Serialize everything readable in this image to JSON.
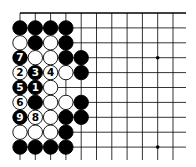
{
  "board": {
    "origin_x": 20,
    "origin_y": 13,
    "spacing_x": 15.3,
    "spacing_y": 14.9,
    "cols": 11,
    "rows": 10,
    "line_end_x": 186,
    "line_end_y": 160,
    "top_edge": true,
    "line_color": "#000000",
    "hoshi": [
      [
        9,
        3
      ],
      [
        9,
        9
      ]
    ]
  },
  "stones": [
    {
      "c": 0,
      "r": 1,
      "color": "black"
    },
    {
      "c": 1,
      "r": 1,
      "color": "black"
    },
    {
      "c": 2,
      "r": 1,
      "color": "black"
    },
    {
      "c": 3,
      "r": 1,
      "color": "black"
    },
    {
      "c": 0,
      "r": 2,
      "color": "white"
    },
    {
      "c": 1,
      "r": 2,
      "color": "black"
    },
    {
      "c": 2,
      "r": 2,
      "color": "white"
    },
    {
      "c": 3,
      "r": 2,
      "color": "black"
    },
    {
      "c": 0,
      "r": 3,
      "color": "black",
      "label": "7"
    },
    {
      "c": 1,
      "r": 3,
      "color": "white"
    },
    {
      "c": 2,
      "r": 3,
      "color": "white"
    },
    {
      "c": 3,
      "r": 3,
      "color": "black"
    },
    {
      "c": 4,
      "r": 3,
      "color": "black"
    },
    {
      "c": 0,
      "r": 4,
      "color": "white",
      "label": "2"
    },
    {
      "c": 1,
      "r": 4,
      "color": "black",
      "label": "3"
    },
    {
      "c": 2,
      "r": 4,
      "color": "white",
      "label": "4"
    },
    {
      "c": 3,
      "r": 4,
      "color": "white"
    },
    {
      "c": 4,
      "r": 4,
      "color": "black"
    },
    {
      "c": 0,
      "r": 5,
      "color": "black",
      "label": "5"
    },
    {
      "c": 1,
      "r": 5,
      "color": "black",
      "label": "1"
    },
    {
      "c": 2,
      "r": 5,
      "color": "white"
    },
    {
      "c": 0,
      "r": 6,
      "color": "white",
      "label": "6"
    },
    {
      "c": 1,
      "r": 6,
      "color": "black"
    },
    {
      "c": 2,
      "r": 6,
      "color": "white"
    },
    {
      "c": 3,
      "r": 6,
      "color": "white"
    },
    {
      "c": 4,
      "r": 6,
      "color": "black"
    },
    {
      "c": 0,
      "r": 7,
      "color": "black",
      "label": "9"
    },
    {
      "c": 1,
      "r": 7,
      "color": "white",
      "label": "8"
    },
    {
      "c": 2,
      "r": 7,
      "color": "white"
    },
    {
      "c": 3,
      "r": 7,
      "color": "black"
    },
    {
      "c": 4,
      "r": 7,
      "color": "black"
    },
    {
      "c": 0,
      "r": 8,
      "color": "white"
    },
    {
      "c": 1,
      "r": 8,
      "color": "white"
    },
    {
      "c": 2,
      "r": 8,
      "color": "white"
    },
    {
      "c": 3,
      "r": 8,
      "color": "black"
    },
    {
      "c": 0,
      "r": 9,
      "color": "black"
    },
    {
      "c": 1,
      "r": 9,
      "color": "black"
    },
    {
      "c": 2,
      "r": 9,
      "color": "black"
    },
    {
      "c": 3,
      "r": 9,
      "color": "black"
    }
  ]
}
